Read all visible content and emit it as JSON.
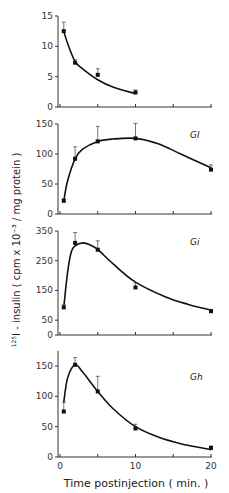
{
  "chart_data": [
    {
      "type": "line",
      "panel_label": "",
      "x": [
        0.5,
        2,
        5,
        10
      ],
      "values": [
        12.5,
        7.3,
        5.3,
        2.4
      ],
      "errors": [
        1.5,
        0.5,
        1.0,
        0.4
      ],
      "curve": [
        [
          0.5,
          12.5
        ],
        [
          1,
          10.5
        ],
        [
          2,
          7.5
        ],
        [
          3,
          6.3
        ],
        [
          5,
          4.5
        ],
        [
          7,
          3.3
        ],
        [
          10,
          2.2
        ]
      ],
      "yticks": [
        "0",
        "5",
        "10",
        "15"
      ],
      "ylim": [
        0,
        15
      ]
    },
    {
      "type": "line",
      "panel_label": "GI",
      "x": [
        0.5,
        2,
        5,
        10,
        20
      ],
      "values": [
        22,
        92,
        121,
        126,
        74
      ],
      "errors": [
        3,
        20,
        25,
        25,
        8
      ],
      "curve": [
        [
          0.5,
          22
        ],
        [
          1,
          55
        ],
        [
          2,
          92
        ],
        [
          3,
          108
        ],
        [
          5,
          121
        ],
        [
          7,
          125
        ],
        [
          10,
          126
        ],
        [
          13,
          117
        ],
        [
          16,
          100
        ],
        [
          20,
          77
        ]
      ],
      "yticks": [
        "0",
        "50",
        "100",
        "150"
      ],
      "ylim": [
        0,
        150
      ]
    },
    {
      "type": "line",
      "panel_label": "Gi",
      "x": [
        0.5,
        2,
        5,
        10,
        20
      ],
      "values": [
        93,
        310,
        287,
        160,
        80
      ],
      "errors": [
        10,
        35,
        30,
        15,
        6
      ],
      "curve": [
        [
          0.5,
          93
        ],
        [
          1,
          210
        ],
        [
          1.5,
          280
        ],
        [
          2,
          300
        ],
        [
          3,
          310
        ],
        [
          4,
          303
        ],
        [
          5,
          288
        ],
        [
          7,
          240
        ],
        [
          10,
          178
        ],
        [
          14,
          128
        ],
        [
          17,
          103
        ],
        [
          20,
          84
        ]
      ],
      "yticks": [
        "0",
        "50",
        "150",
        "250",
        "350"
      ],
      "ylim": [
        0,
        350
      ]
    },
    {
      "type": "line",
      "panel_label": "Gh",
      "x": [
        0.5,
        2,
        5,
        10,
        20
      ],
      "values": [
        75,
        152,
        108,
        47,
        15
      ],
      "errors": [
        15,
        12,
        25,
        7,
        3
      ],
      "curve": [
        [
          0.5,
          90
        ],
        [
          1,
          130
        ],
        [
          2,
          152
        ],
        [
          3,
          140
        ],
        [
          5,
          108
        ],
        [
          7,
          80
        ],
        [
          10,
          50
        ],
        [
          13,
          33
        ],
        [
          16,
          22
        ],
        [
          20,
          12
        ]
      ],
      "yticks": [
        "0",
        "50",
        "100",
        "150"
      ],
      "ylim": [
        0,
        175
      ]
    }
  ],
  "labels": {
    "ylabel_sup": "125",
    "ylabel": "I - insulin ( cpm x 10⁻³ / mg protein )",
    "xlabel": "Time  postinjection  ( min. )",
    "xticks": [
      "0",
      "10",
      "20"
    ]
  }
}
